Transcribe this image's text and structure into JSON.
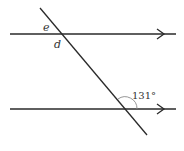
{
  "diagram": {
    "type": "parallel-lines-transversal",
    "colors": {
      "line": "#2a2a2a",
      "arc": "#8a8a8a",
      "text": "#333333"
    },
    "lines": [
      {
        "name": "upper-parallel-line",
        "x1": 10,
        "y1": 34,
        "x2": 176,
        "y2": 34,
        "arrow_at": 162
      },
      {
        "name": "lower-parallel-line",
        "x1": 10,
        "y1": 109,
        "x2": 176,
        "y2": 109,
        "arrow_at": 162
      },
      {
        "name": "transversal",
        "x1": 40,
        "y1": 8,
        "x2": 147,
        "y2": 135
      }
    ],
    "labels": {
      "angle_e": "e",
      "angle_d": "d",
      "angle_given": "131°"
    }
  }
}
